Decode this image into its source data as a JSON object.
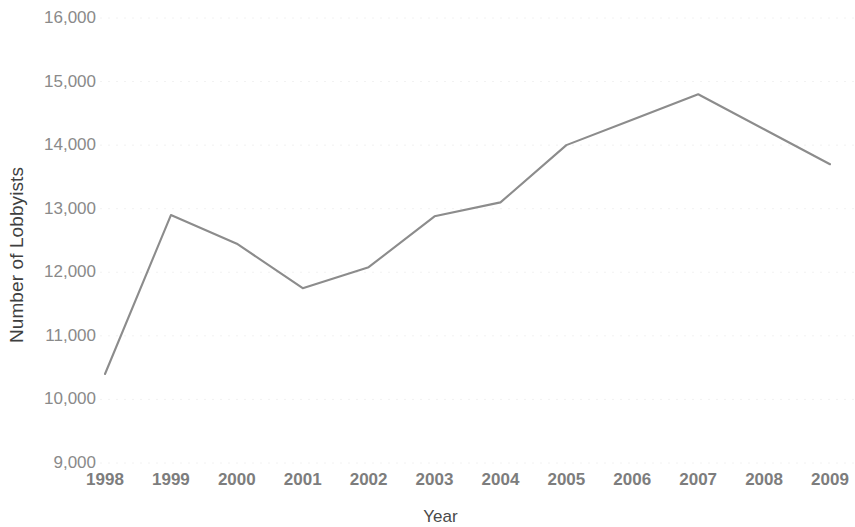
{
  "chart_data": {
    "type": "line",
    "title": "",
    "subtitle": "",
    "xlabel": "Year",
    "ylabel": "Number of Lobbyists",
    "categories": [
      "1998",
      "1999",
      "2000",
      "2001",
      "2002",
      "2003",
      "2004",
      "2005",
      "2006",
      "2007",
      "2008",
      "2009"
    ],
    "x": [
      1998,
      1999,
      2000,
      2001,
      2002,
      2003,
      2004,
      2005,
      2006,
      2007,
      2008,
      2009
    ],
    "values": [
      10400,
      12900,
      12450,
      11750,
      12080,
      12880,
      13100,
      14000,
      14400,
      14800,
      14250,
      13700
    ],
    "series": [
      {
        "name": "Number of Lobbyists",
        "values": [
          10400,
          12900,
          12450,
          11750,
          12080,
          12880,
          13100,
          14000,
          14400,
          14800,
          14250,
          13700
        ],
        "color": "#8c8c8c"
      }
    ],
    "ylim": [
      9000,
      16000
    ],
    "xlim": [
      1998,
      2009
    ],
    "y_ticks": [
      9000,
      10000,
      11000,
      12000,
      13000,
      14000,
      15000,
      16000
    ],
    "y_tick_labels": [
      "9,000",
      "10,000",
      "11,000",
      "12,000",
      "13,000",
      "14,000",
      "15,000",
      "16,000"
    ],
    "x_ticks": [
      1998,
      1999,
      2000,
      2001,
      2002,
      2003,
      2004,
      2005,
      2006,
      2007,
      2008,
      2009
    ],
    "x_tick_labels": [
      "1998",
      "1999",
      "2000",
      "2001",
      "2002",
      "2003",
      "2004",
      "2005",
      "2006",
      "2007",
      "2008",
      "2009"
    ],
    "grid": true,
    "grid_axis": "y",
    "grid_style": "dotted",
    "grid_color": "#f2f2f2",
    "legend": false,
    "legend_position": "none",
    "markers": false,
    "annotations": []
  },
  "axes": {
    "y_title": "Number of Lobbyists",
    "x_title": "Year"
  },
  "colors": {
    "line": "#8c8c8c",
    "grid": "#f2f2f2",
    "tick_text": "#8a8a8a",
    "axis_title_text": "#3f3f3f",
    "background": "#ffffff"
  }
}
